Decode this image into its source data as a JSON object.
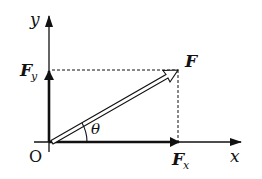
{
  "diagram": {
    "labels": {
      "y_axis": "y",
      "x_axis": "x",
      "origin": "O",
      "force": "F",
      "fy_main": "F",
      "fy_sub": "y",
      "fx_main": "F",
      "fx_sub": "x",
      "angle": "θ"
    },
    "colors": {
      "stroke": "#111111",
      "background": "#ffffff"
    }
  }
}
